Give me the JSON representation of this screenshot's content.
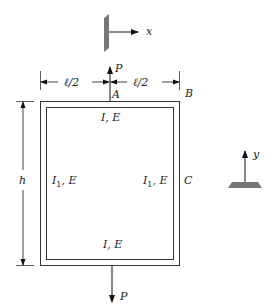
{
  "diagram": {
    "type": "structural-frame",
    "axes": {
      "x_label": "x",
      "y_label": "y"
    },
    "loads": {
      "top_load": "P",
      "bottom_load": "P"
    },
    "points": {
      "a": "A",
      "b": "B",
      "c": "C"
    },
    "dimensions": {
      "left_half": "ℓ/2",
      "right_half": "ℓ/2",
      "height": "h"
    },
    "members": {
      "top": "I, E",
      "bottom": "I, E",
      "left_main": "I",
      "left_sub": "1",
      "left_rest": ", E",
      "right_main": "I",
      "right_sub": "1",
      "right_rest": ", E"
    },
    "colors": {
      "line": "#333333",
      "support": "#777777"
    }
  }
}
